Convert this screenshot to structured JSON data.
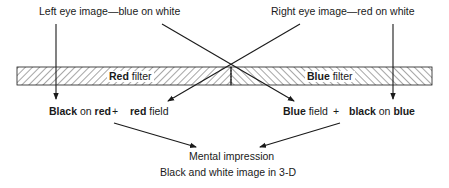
{
  "diagram": {
    "top_labels": {
      "left_eye": "Left eye image—blue on white",
      "right_eye": "Right eye image—red on white"
    },
    "filters": {
      "red": {
        "bold": "Red",
        "rest": " filter"
      },
      "blue": {
        "bold": "Blue",
        "rest": " filter"
      }
    },
    "left_result": {
      "part1_bold": "Black",
      "part1_mid": " on ",
      "part1_end_bold": "red",
      "plus": "+",
      "part2_bold": "red",
      "part2_rest": " field"
    },
    "right_result": {
      "part1_bold": "Blue",
      "part1_rest": " field",
      "plus": "+",
      "part2_bold": "black",
      "part2_mid": " on ",
      "part2_end_bold": "blue"
    },
    "outcome": {
      "title": "Mental impression",
      "subtitle": "Black and white image in 3-D"
    },
    "colors": {
      "line": "#1a1a1a",
      "hatch": "#3a3a3a",
      "background": "#ffffff"
    }
  }
}
